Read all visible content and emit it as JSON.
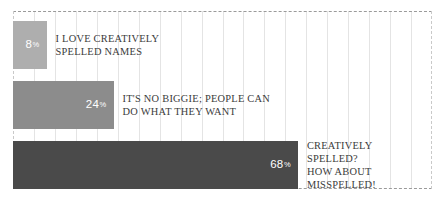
{
  "chart_data": {
    "type": "bar",
    "orientation": "horizontal",
    "title": "",
    "subtitle": "",
    "xlabel": "",
    "ylabel": "",
    "xlim": [
      0,
      100
    ],
    "grid": true,
    "grid_axis": "x",
    "legend": false,
    "value_suffix": "%",
    "categories": [
      "I LOVE CREATIVELY SPELLED NAMES",
      "IT'S NO BIGGIE; PEOPLE CAN DO WHAT THEY WANT",
      "CREATIVELY SPELLED? HOW ABOUT MISSPELLED!"
    ],
    "values": [
      8,
      24,
      68
    ],
    "bar_colors": [
      "#aeaeae",
      "#8c8c8c",
      "#4a4a4a"
    ],
    "value_label_color": "#ffffff",
    "category_label_color": "#3b3b3b",
    "gridline_color": "#e4e4e4",
    "border_color": "#9a9a9a",
    "background": "#ffffff"
  },
  "bars": [
    {
      "value": 8,
      "value_text": "8",
      "percent_sign": "%",
      "color": "#aeaeae",
      "label_lines": [
        "I LOVE CREATIVELY",
        "SPELLED NAMES"
      ]
    },
    {
      "value": 24,
      "value_text": "24",
      "percent_sign": "%",
      "color": "#8c8c8c",
      "label_lines": [
        "IT'S NO BIGGIE; PEOPLE CAN",
        "DO WHAT THEY WANT"
      ]
    },
    {
      "value": 68,
      "value_text": "68",
      "percent_sign": "%",
      "color": "#4a4a4a",
      "label_lines": [
        "CREATIVELY",
        "SPELLED?",
        "HOW ABOUT",
        "MISSPELLED!"
      ]
    }
  ],
  "gridlines": {
    "count": 19,
    "spacing_pct": 5
  }
}
